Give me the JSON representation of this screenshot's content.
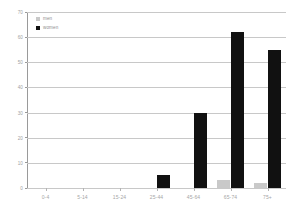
{
  "chart_data": {
    "type": "bar",
    "title": "",
    "subtitle": "",
    "xlabel": "",
    "ylabel": "",
    "categories": [
      "0-4",
      "5-14",
      "15-24",
      "25-44",
      "45-64",
      "65-74",
      "75+"
    ],
    "series": [
      {
        "name": "men",
        "color": "#c9c9c9",
        "values": [
          0,
          0,
          0,
          0,
          0,
          3,
          2
        ]
      },
      {
        "name": "women",
        "color": "#111111",
        "values": [
          0,
          0,
          0,
          5,
          30,
          62,
          55
        ]
      }
    ],
    "ylim": [
      0,
      70
    ],
    "yticks": [
      0,
      10,
      20,
      30,
      40,
      50,
      60,
      70
    ],
    "ytick_labels": [
      "0",
      "10",
      "20",
      "30",
      "40",
      "50",
      "60",
      "70"
    ],
    "grid": true,
    "grid_axis": "y",
    "legend": [
      "men",
      "women"
    ],
    "legend_position": "top-left",
    "bar_mode": "grouped"
  },
  "colors": {
    "background": "#ffffff",
    "gridline": "#c8c8c8",
    "axis": "#9a9a9a",
    "tick_text": "#a0a0a0",
    "men": "#c9c9c9",
    "women": "#111111"
  }
}
